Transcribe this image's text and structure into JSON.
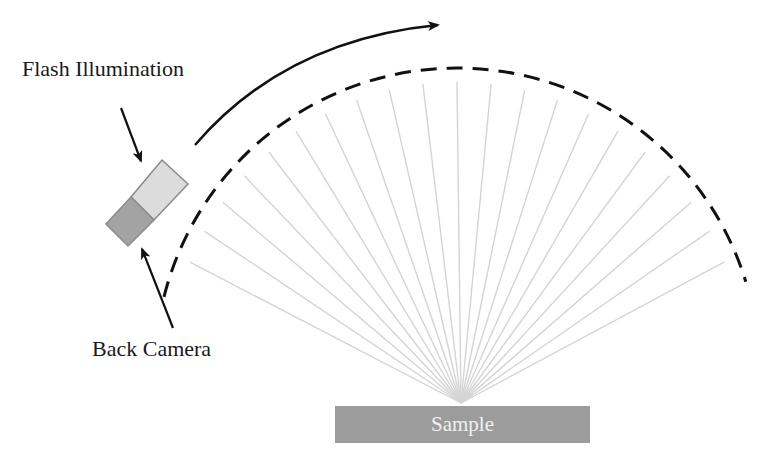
{
  "diagram": {
    "labels": {
      "flash": "Flash Illumination",
      "camera": "Back Camera",
      "sample": "Sample"
    },
    "colors": {
      "sample_fill": "#9c9c9c",
      "flash_fill": "#dcdcdc",
      "camera_fill": "#a3a3a3",
      "device_stroke": "#8a8a8a",
      "ray_stroke": "#d4d4d4",
      "arc_stroke": "#111111"
    },
    "rays": {
      "count": 21,
      "origin": [
        461,
        403
      ],
      "arc_center": [
        457,
        370
      ],
      "end_radius": 288,
      "start_angle_deg": -158,
      "end_angle_deg": -22
    },
    "dashed_arc": {
      "center": [
        457,
        370
      ],
      "radius": 302,
      "start_angle_deg": -166,
      "end_angle_deg": -17
    }
  }
}
